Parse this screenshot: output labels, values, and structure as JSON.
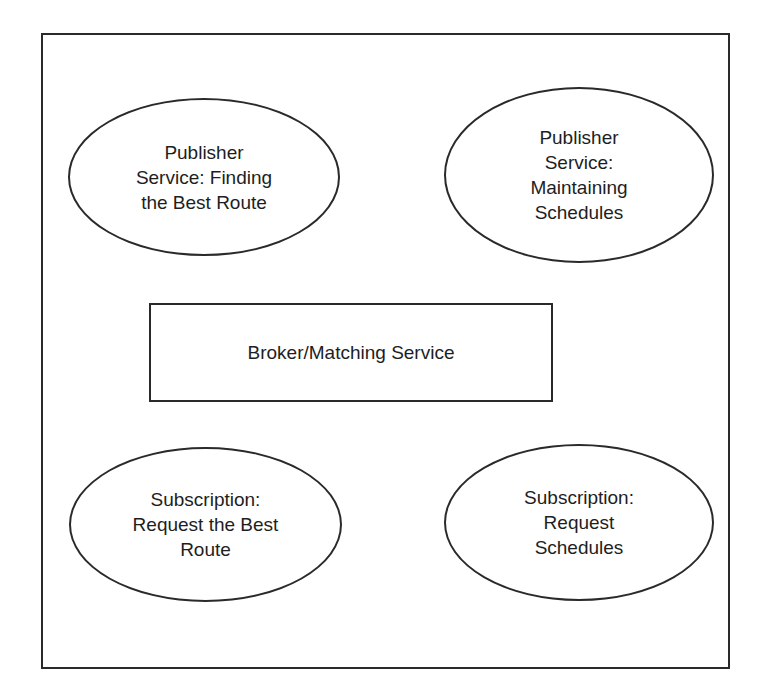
{
  "diagram": {
    "frame": {
      "border_color": "#2a2a2a"
    },
    "nodes": [
      {
        "id": "pub-route",
        "shape": "ellipse",
        "label": "Publisher\nService: Finding\nthe Best Route"
      },
      {
        "id": "pub-sched",
        "shape": "ellipse",
        "label": "Publisher\nService:\nMaintaining\nSchedules"
      },
      {
        "id": "broker",
        "shape": "rectangle",
        "label": "Broker/Matching Service"
      },
      {
        "id": "sub-route",
        "shape": "ellipse",
        "label": "Subscription:\nRequest the Best\nRoute"
      },
      {
        "id": "sub-sched",
        "shape": "ellipse",
        "label": "Subscription:\nRequest\nSchedules"
      }
    ],
    "edges": []
  }
}
